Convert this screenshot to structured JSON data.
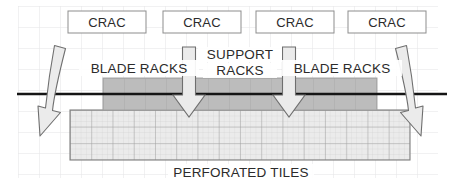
{
  "diagram": {
    "background_color": "#ffffff",
    "grid": {
      "color": "#e2e2e4",
      "cell_size": 21,
      "origin_x": 18,
      "origin_y": 6,
      "cols": 21,
      "rows": 8
    },
    "floor_line": {
      "color": "#1a1a1a",
      "y": 94,
      "x_start": 17,
      "x_end": 447,
      "thickness": 2.6
    },
    "crac_units": [
      {
        "label": "CRAC",
        "x": 68,
        "y": 11,
        "width": 78,
        "height": 22
      },
      {
        "label": "CRAC",
        "x": 163,
        "y": 11,
        "width": 78,
        "height": 22
      },
      {
        "label": "CRAC",
        "x": 256,
        "y": 11,
        "width": 78,
        "height": 22
      },
      {
        "label": "CRAC",
        "x": 348,
        "y": 11,
        "width": 78,
        "height": 22
      }
    ],
    "crac_box_style": {
      "fill": "#ffffff",
      "stroke": "#8a8a8a",
      "stroke_width": 1
    },
    "rack_band": {
      "label": "racks",
      "x": 103,
      "y": 78,
      "width": 274,
      "height": 32,
      "fill": "#b9b9b9",
      "stroke": "#9a9a9a"
    },
    "perforated_tiles": {
      "label": "PERFORATED TILES",
      "x": 70,
      "y": 110,
      "width": 340,
      "height": 50,
      "fill": "#e8e8e8",
      "stroke": "#8e8e8e",
      "tile_cols": 16,
      "tile_rows": 3
    },
    "labels": {
      "blade_racks_left": "BLADE RACKS",
      "support_racks_line1": "SUPPORT",
      "support_racks_line2": "RACKS",
      "blade_racks_right": "BLADE RACKS",
      "perforated_tiles": "PERFORATED TILES"
    },
    "label_positions": {
      "blade_racks_left": {
        "x": 140,
        "y": 72
      },
      "support_racks_line1": {
        "x": 239,
        "y": 59
      },
      "support_racks_line2": {
        "x": 239,
        "y": 75
      },
      "blade_racks_right": {
        "x": 341,
        "y": 72
      },
      "perforated_tiles": {
        "x": 240,
        "y": 176
      }
    },
    "supply_arrows": [
      {
        "name": "supply-arrow-left",
        "x_center": 189,
        "y_top": 47,
        "y_tip": 117,
        "shaft_half_width": 6.5,
        "head_half_width": 16
      },
      {
        "name": "supply-arrow-right",
        "x_center": 289,
        "y_top": 47,
        "y_tip": 117,
        "shaft_half_width": 6.5,
        "head_half_width": 16
      }
    ],
    "return_arrows": [
      {
        "name": "return-arrow-left",
        "direction": "down-left",
        "top_x": 57,
        "top_y": 46,
        "tip_x": 40,
        "tip_y": 135
      },
      {
        "name": "return-arrow-right",
        "direction": "down-right",
        "top_x": 404,
        "top_y": 46,
        "tip_x": 421,
        "tip_y": 135
      }
    ],
    "arrow_style": {
      "fill": "#e9e9e9",
      "stroke": "#6f6f6f",
      "stroke_width": 1.1
    }
  }
}
